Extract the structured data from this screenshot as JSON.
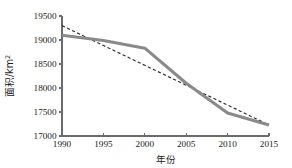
{
  "chart_data": {
    "type": "line",
    "title": "",
    "xlabel": "年份",
    "ylabel": "面积/km²",
    "ylabel_base": "面积/km",
    "ylabel_sup": "2",
    "x": [
      1990,
      1995,
      2000,
      2005,
      2010,
      2015
    ],
    "xlim": [
      1990,
      2015
    ],
    "ylim": [
      17000,
      19500
    ],
    "xticks": [
      "1990",
      "1995",
      "2000",
      "2005",
      "2010",
      "2015"
    ],
    "yticks": [
      "17000",
      "17500",
      "18000",
      "18500",
      "19000",
      "19500"
    ],
    "ytick_values": [
      17000,
      17500,
      18000,
      18500,
      19000,
      19500
    ],
    "xtick_values": [
      1990,
      1995,
      2000,
      2005,
      2010,
      2015
    ],
    "grid": false,
    "legend": "none",
    "series": [
      {
        "name": "面积",
        "style": "solid",
        "color": "#8a8a8a",
        "x": [
          1990,
          1995,
          2000,
          2005,
          2010,
          2015
        ],
        "values": [
          19100,
          18990,
          18830,
          18100,
          17480,
          17230
        ]
      },
      {
        "name": "线性趋势线",
        "style": "dashed",
        "color": "#2b2b2b",
        "x": [
          1990,
          2015
        ],
        "values": [
          19300,
          17230
        ]
      }
    ]
  },
  "colors": {
    "axis": "#6b6b6b",
    "text": "#1a1a1a",
    "series_solid": "#8a8a8a",
    "series_dashed": "#2b2b2b",
    "background": "#ffffff"
  }
}
